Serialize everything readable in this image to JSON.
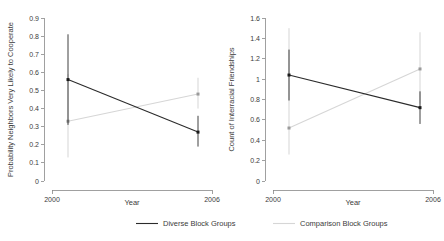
{
  "figure": {
    "background": "#ffffff",
    "width": 444,
    "height": 241
  },
  "colors": {
    "diverse": "#2b2b2b",
    "comparison": "#d6d6d6",
    "axis": "#888888",
    "text": "#3b3b3b"
  },
  "legend": {
    "position": "bottom",
    "entries": [
      {
        "label": "Diverse Block Groups",
        "color": "#2b2b2b"
      },
      {
        "label": "Comparison Block Groups",
        "color": "#d6d6d6"
      }
    ]
  },
  "left_panel": {
    "ylabel": "Probability Neighbors Very Likely to Cooperate",
    "xlabel": "Year",
    "yticks": [
      "0",
      "0.1",
      "0.2",
      "0.3",
      "0.4",
      "0.5",
      "0.6",
      "0.7",
      "0.8",
      "0.9"
    ],
    "xticks": [
      "2000",
      "2006"
    ]
  },
  "right_panel": {
    "ylabel": "Count of Interracial Friendships",
    "xlabel": "Year",
    "yticks": [
      "0",
      "0.2",
      "0.4",
      "0.6",
      "0.8",
      "1",
      "1.2",
      "1.4",
      "1.6"
    ],
    "xticks": [
      "2000",
      "2006"
    ]
  },
  "chart_data": [
    {
      "type": "line",
      "title": "",
      "panel": "left",
      "xlabel": "Year",
      "ylabel": "Probability Neighbors Very Likely to Cooperate",
      "x": [
        2000,
        2006
      ],
      "xtick_labels": [
        "2000",
        "2006"
      ],
      "ylim": [
        0,
        0.9
      ],
      "ytick_values": [
        0,
        0.1,
        0.2,
        0.3,
        0.4,
        0.5,
        0.6,
        0.7,
        0.8,
        0.9
      ],
      "grid": false,
      "errorbars": true,
      "series": [
        {
          "name": "Diverse Block Groups",
          "color": "#2b2b2b",
          "values": [
            0.56,
            0.27
          ],
          "ci_low": [
            0.31,
            0.19
          ],
          "ci_high": [
            0.81,
            0.36
          ]
        },
        {
          "name": "Comparison Block Groups",
          "color": "#d6d6d6",
          "values": [
            0.33,
            0.48
          ],
          "ci_low": [
            0.13,
            0.4
          ],
          "ci_high": [
            0.59,
            0.57
          ]
        }
      ]
    },
    {
      "type": "line",
      "title": "",
      "panel": "right",
      "xlabel": "Year",
      "ylabel": "Count of Interracial Friendships",
      "x": [
        2000,
        2006
      ],
      "xtick_labels": [
        "2000",
        "2006"
      ],
      "ylim": [
        0,
        1.6
      ],
      "ytick_values": [
        0,
        0.2,
        0.4,
        0.6,
        0.8,
        1.0,
        1.2,
        1.4,
        1.6
      ],
      "grid": false,
      "errorbars": true,
      "series": [
        {
          "name": "Diverse Block Groups",
          "color": "#2b2b2b",
          "values": [
            1.04,
            0.72
          ],
          "ci_low": [
            0.79,
            0.56
          ],
          "ci_high": [
            1.29,
            0.88
          ]
        },
        {
          "name": "Comparison Block Groups",
          "color": "#d6d6d6",
          "values": [
            0.52,
            1.1
          ],
          "ci_low": [
            0.26,
            0.76
          ],
          "ci_high": [
            1.5,
            1.46
          ]
        }
      ]
    }
  ]
}
